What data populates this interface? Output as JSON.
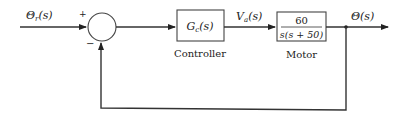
{
  "diagram": {
    "type": "feedback-control-block-diagram",
    "input_signal": {
      "symbol": "Θ",
      "subscript": "r",
      "arg": "(s)"
    },
    "summing_junction": {
      "plus_sign": "+",
      "minus_sign": "−"
    },
    "controller": {
      "transfer": {
        "symbol": "G",
        "subscript": "c",
        "arg": "(s)"
      },
      "caption": "Controller"
    },
    "intermediate_signal": {
      "symbol": "V",
      "subscript": "a",
      "arg": "(s)"
    },
    "motor": {
      "numerator": "60",
      "denominator": "s(s + 50)",
      "caption": "Motor"
    },
    "output_signal": {
      "symbol": "Θ",
      "arg": "(s)"
    },
    "feedback": "unity negative feedback"
  }
}
